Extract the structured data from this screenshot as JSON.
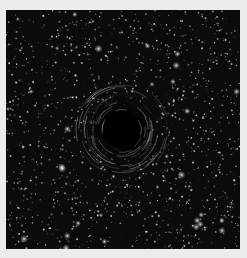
{
  "image": {
    "description": "Simulated starfield with a dark gravitational-lensing swirl at center",
    "background_color": "#ececec",
    "field_color": "#0b0b0b",
    "star_color": "#e8e8e8",
    "hole": {
      "cx": 116,
      "cy": 120,
      "core_radius": 16,
      "swirl_radius": 44
    },
    "star_count": 1400,
    "bright_star_count": 40
  }
}
